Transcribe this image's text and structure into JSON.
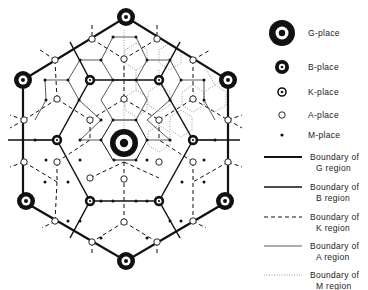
{
  "colors": {
    "ink": "#111111",
    "background": "#ffffff"
  },
  "legend": {
    "places": [
      {
        "id": "G",
        "label": "G-place",
        "y": 33
      },
      {
        "id": "B",
        "label": "B-place",
        "y": 67
      },
      {
        "id": "K",
        "label": "K-place",
        "y": 92
      },
      {
        "id": "A",
        "label": "A-place",
        "y": 115
      },
      {
        "id": "M",
        "label": "M-place",
        "y": 135
      }
    ],
    "boundaries": [
      {
        "id": "G",
        "line1": "Boundary of",
        "line2": "G region",
        "y": 158
      },
      {
        "id": "B",
        "line1": "Boundary of",
        "line2": "B region",
        "y": 188
      },
      {
        "id": "K",
        "line1": "Boundary of",
        "line2": "K region",
        "y": 218
      },
      {
        "id": "A",
        "line1": "Boundary of",
        "line2": "A region",
        "y": 247
      },
      {
        "id": "M",
        "line1": "Boundary of",
        "line2": "M region",
        "y": 276
      }
    ]
  },
  "diagram": {
    "g_places": [
      [
        126,
        17
      ],
      [
        23,
        80
      ],
      [
        228,
        80
      ],
      [
        124,
        143
      ],
      [
        26,
        201
      ],
      [
        225,
        201
      ],
      [
        126,
        261
      ]
    ],
    "b_places": [
      [
        90,
        80
      ],
      [
        159,
        80
      ],
      [
        57,
        140
      ],
      [
        193,
        140
      ],
      [
        90,
        201
      ],
      [
        159,
        201
      ]
    ],
    "k_places": [],
    "a_places": [
      [
        92,
        39
      ],
      [
        157,
        39
      ],
      [
        55,
        60
      ],
      [
        193,
        60
      ],
      [
        124,
        59
      ],
      [
        57,
        99
      ],
      [
        124,
        99
      ],
      [
        193,
        99
      ],
      [
        24,
        120
      ],
      [
        228,
        120
      ],
      [
        90,
        120
      ],
      [
        159,
        120
      ],
      [
        24,
        162
      ],
      [
        228,
        162
      ],
      [
        57,
        162
      ],
      [
        90,
        178
      ],
      [
        124,
        179
      ],
      [
        159,
        162
      ],
      [
        193,
        162
      ],
      [
        55,
        221
      ],
      [
        124,
        222
      ],
      [
        193,
        221
      ],
      [
        92,
        242
      ],
      [
        157,
        242
      ]
    ],
    "m_places": [
      [
        113,
        37
      ],
      [
        136,
        37
      ],
      [
        80,
        60
      ],
      [
        101,
        60
      ],
      [
        147,
        60
      ],
      [
        170,
        60
      ],
      [
        68,
        80
      ],
      [
        113,
        80
      ],
      [
        136,
        80
      ],
      [
        181,
        80
      ],
      [
        45,
        80
      ],
      [
        204,
        80
      ],
      [
        46,
        100
      ],
      [
        79,
        100
      ],
      [
        170,
        100
      ],
      [
        204,
        100
      ],
      [
        35,
        140
      ],
      [
        80,
        140
      ],
      [
        101,
        140
      ],
      [
        147,
        140
      ],
      [
        170,
        140
      ],
      [
        215,
        140
      ],
      [
        46,
        160
      ],
      [
        204,
        160
      ],
      [
        80,
        160
      ],
      [
        147,
        160
      ],
      [
        113,
        120
      ],
      [
        136,
        120
      ],
      [
        101,
        120
      ],
      [
        45,
        182
      ],
      [
        68,
        182
      ],
      [
        182,
        182
      ],
      [
        204,
        182
      ],
      [
        101,
        201
      ],
      [
        113,
        201
      ],
      [
        136,
        201
      ],
      [
        147,
        201
      ],
      [
        80,
        221
      ],
      [
        170,
        221
      ],
      [
        101,
        238
      ],
      [
        147,
        238
      ],
      [
        114,
        160
      ],
      [
        136,
        160
      ],
      [
        68,
        221
      ],
      [
        181,
        221
      ]
    ]
  }
}
